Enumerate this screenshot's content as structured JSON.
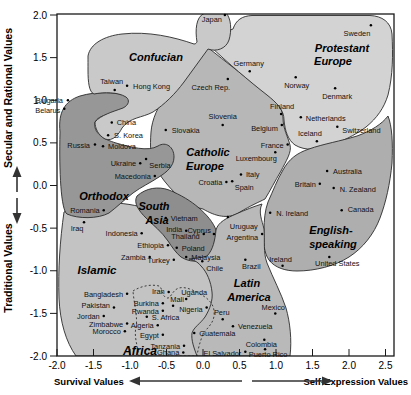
{
  "chart_data": {
    "type": "scatter",
    "xlabel_left": "Survival Values",
    "xlabel_right": "Self-Expression Values",
    "ylabel_top": "Secular and Rational Values",
    "ylabel_bottom": "Traditional Values",
    "xlim": [
      -2.0,
      2.62
    ],
    "ylim": [
      -2.0,
      2.0
    ],
    "x_ticks": [
      {
        "v": -2.0,
        "t": "-2.0"
      },
      {
        "v": -1.5,
        "t": "-1.5"
      },
      {
        "v": -1.0,
        "t": "-1.0"
      },
      {
        "v": -0.5,
        "t": "-0.5"
      },
      {
        "v": 0.0,
        "t": "0.0"
      },
      {
        "v": 0.5,
        "t": "0.5"
      },
      {
        "v": 1.0,
        "t": "1.0"
      },
      {
        "v": 1.5,
        "t": "1.5"
      },
      {
        "v": 2.0,
        "t": "2.0"
      },
      {
        "v": 2.5,
        "t": "2.5"
      }
    ],
    "y_ticks": [
      {
        "v": 2.0,
        "t": "2.0"
      },
      {
        "v": 1.5,
        "t": "1.5"
      },
      {
        "v": 1.0,
        "t": "1.0"
      },
      {
        "v": 0.5,
        "t": "0.5"
      },
      {
        "v": 0.0,
        "t": "0.0"
      },
      {
        "v": -0.5,
        "t": "-0.5"
      },
      {
        "v": -1.0,
        "t": "-1.0"
      },
      {
        "v": -1.5,
        "t": "-1.5"
      },
      {
        "v": -2.0,
        "t": "-2.0"
      }
    ],
    "grid": false,
    "regions": [
      {
        "name": "catholic-europe",
        "color": "#b7b7b7",
        "path": "M 206,46 C 192,60 178,76 168,92 C 158,106 152,119 151,132 C 150,146 150,159 156,169 C 161,177 167,185 175,193 C 183,201 193,207 203,209 C 215,216 228,220 240,212 C 250,206 259,202 265,199 C 270,191 275,181 281,171 C 286,161 292,152 290,145 C 288,137 283,129 283,118 C 283,108 276,101 266,93 C 248,79 226,62 206,46 Z",
        "label": {
          "size": 11,
          "lines": [
            {
              "t": "Catholic",
              "x": 208,
              "y": 156
            },
            {
              "t": "Europe",
              "x": 205,
              "y": 170
            }
          ]
        }
      },
      {
        "name": "protestant-europe",
        "color": "#d3d3d3",
        "path": "M 210,46 C 216,38 224,32 233,29 C 236,20 242,16 252,15.5 L 370,15.5 C 382,16 391,22 392,34 C 393,55 393,75 388,95 C 384,108 377,118 366,127 C 354,136 342,141 330,146 C 318,150 305,151 295,145 C 288,140 285,131 284,120 C 284,110 277,103 267,95 C 249,81 228,63 210,46 Z",
        "label": {
          "size": 11,
          "lines": [
            {
              "t": "Protestant",
              "x": 342,
              "y": 52
            },
            {
              "t": "Europe",
              "x": 333,
              "y": 65
            }
          ]
        }
      },
      {
        "name": "islamic",
        "color": "#c3c3c3",
        "path": "M 64,212 C 88,200 122,200 152,210 C 176,218 196,232 208,250 C 217,264 221,282 219,300 C 217,320 212,338 208,356 L 76,356 C 66,342 60,322 59,298 C 58,270 60,240 64,212 Z",
        "label": {
          "size": 11.5,
          "lines": [
            {
              "t": "Islamic",
              "x": 97,
              "y": 274
            }
          ]
        }
      },
      {
        "name": "orthodox",
        "color": "#979797",
        "path": "M 60,132 C 58,112 65,101 80,96 C 97,91 117,92 128,96 C 134,99 133,105 125,109 C 112,115 99,114 95,122 C 93,133 103,139 116,143 C 130,147 148,152 158,146 C 166,141 174,147 174,157 C 174,166 167,172 159,177 C 150,183 141,187 133,193 C 124,200 117,207 109,213 C 98,219 78,219 67,214 C 61,210 59,172 60,132 Z",
        "label": {
          "size": 11,
          "lines": [
            {
              "t": "Orthodox",
              "x": 104,
              "y": 200
            }
          ]
        }
      },
      {
        "name": "south-asia",
        "color": "#8e8e8e",
        "path": "M 137,196 C 146,188 158,186 169,190 C 181,195 191,201 199,208 C 207,215 213,222 216,230 C 218,241 214,251 207,257 C 199,263 189,262 181,257 C 176,253 172,247 168,241 C 162,232 153,225 146,218 C 139,211 133,203 137,196 Z",
        "label": {
          "size": 11,
          "lines": [
            {
              "t": "South",
              "x": 154,
              "y": 210
            },
            {
              "t": "Asia",
              "x": 157,
              "y": 224
            }
          ]
        }
      },
      {
        "name": "confucian",
        "color": "#c9c9c9",
        "path": "M 88,56 C 90,44 104,36 122,34 C 148,31 174,37 194,44 C 196,44 196,43 197,42 C 195,30 196,17 204,13.5 L 226,13 C 231,18 232,30 229,40 C 226,49 216,52 208,49 C 200,60 192,71 184,82 C 175,94 165,104 153,112 C 142,118 130,117 122,128 C 119,134 113,142 105,139 C 98,135 95,128 95,122 C 101,115 112,112 123,108 C 129,105 130,100 126,97 C 118,92 104,92 94,94 C 89,92 88,82 88,70 C 88,65 88,60 88,56 Z",
        "label": {
          "size": 11,
          "lines": [
            {
              "t": "Confucian",
              "x": 156,
              "y": 61
            }
          ]
        }
      },
      {
        "name": "english-speaking",
        "color": "#aeaeae",
        "path": "M 268,202 C 273,191 277,180 283,170 C 289,159 297,153 309,149 C 323,144 341,141 357,136 C 371,131 382,124 388,116 C 392,126 393,143 392,163 C 390,184 386,202 380,218 C 374,234 363,248 349,257 C 335,266 315,271 297,271 C 286,271 275,268 269,260 C 264,253 263,242 264,230 C 264,220 265,210 268,202 Z",
        "label": {
          "size": 11,
          "lines": [
            {
              "t": "English-",
              "x": 331,
              "y": 234
            },
            {
              "t": "speaking",
              "x": 333,
              "y": 248
            }
          ]
        }
      },
      {
        "name": "latin-america",
        "color": "#b9b9b9",
        "path": "M 262,204 C 258,212 262,220 264,229 C 265,241 263,252 267,263 C 273,278 281,293 286,308 C 290,322 292,340 290,356 L 197,356 C 194,348 191,340 192,333 C 194,327 200,324 205,317 C 210,309 213,300 212,292 C 211,282 207,272 201,266 C 197,261 193,260 189,259 C 196,258 202,258 207,256 C 213,250 215,240 216,230 C 218,222 227,218 236,214 C 245,210 255,206 262,204 Z",
        "label": {
          "size": 11,
          "lines": [
            {
              "t": "Latin",
              "x": 247,
              "y": 287
            },
            {
              "t": "America",
              "x": 249,
              "y": 301
            }
          ]
        }
      },
      {
        "name": "africa",
        "color": "none",
        "dash": "2,2.2",
        "path": "M 133,291 C 141,286 151,284 159,286 C 163,288 161,296 167,298 C 171,299 172,290 179,288 C 187,286 197,292 205,297 C 212,302 215,308 214,316 C 213,324 207,328 203,334 C 200,342 198,349 197,356 L 139,356 C 137,344 134,336 136,327 C 138,318 134,304 133,291 Z",
        "label": {
          "size": 12,
          "lines": [
            {
              "t": "Africa",
              "x": 140,
              "y": 355
            }
          ]
        }
      }
    ],
    "countries": [
      {
        "name": "Japan",
        "x": 0.3,
        "y": 2.0,
        "anchor": "end",
        "ldx": -3,
        "ldy": 7
      },
      {
        "name": "Sweden",
        "x": 2.3,
        "y": 1.88,
        "anchor": "middle",
        "ldx": -14,
        "ldy": 11
      },
      {
        "name": "Germany",
        "x": 0.64,
        "y": 1.34,
        "anchor": "middle",
        "ldx": -1,
        "ldy": -5
      },
      {
        "name": "Norway",
        "x": 1.27,
        "y": 1.27,
        "anchor": "middle",
        "ldx": 1,
        "ldy": 11
      },
      {
        "name": "Denmark",
        "x": 1.81,
        "y": 1.14,
        "anchor": "middle",
        "ldx": 2,
        "ldy": 11
      },
      {
        "name": "Taiwan",
        "x": -1.21,
        "y": 1.12,
        "anchor": "middle",
        "ldx": -3,
        "ldy": -6
      },
      {
        "name": "Hong Kong",
        "x": -1.04,
        "y": 1.17,
        "anchor": "start",
        "ldx": 6,
        "ldy": 3
      },
      {
        "name": "Czech Rep.",
        "x": 0.34,
        "y": 1.25,
        "anchor": "middle",
        "ldx": -17,
        "ldy": 11
      },
      {
        "name": "Bulgaria",
        "x": -1.85,
        "y": 1.0,
        "anchor": "end",
        "ldx": -5,
        "ldy": 3
      },
      {
        "name": "Belarus",
        "x": -1.9,
        "y": 0.9,
        "anchor": "end",
        "ldx": -4,
        "ldy": 4
      },
      {
        "name": "China",
        "x": -1.25,
        "y": 0.74,
        "anchor": "start",
        "ldx": 5,
        "ldy": 3
      },
      {
        "name": "S. Korea",
        "x": -1.3,
        "y": 0.59,
        "anchor": "start",
        "ldx": 6,
        "ldy": 3
      },
      {
        "name": "Slovakia",
        "x": -0.51,
        "y": 0.65,
        "anchor": "start",
        "ldx": 6,
        "ldy": 3
      },
      {
        "name": "Slovenia",
        "x": 0.27,
        "y": 0.71,
        "anchor": "middle",
        "ldx": 0,
        "ldy": -6
      },
      {
        "name": "Finland",
        "x": 1.07,
        "y": 0.84,
        "anchor": "middle",
        "ldx": 1,
        "ldy": -5
      },
      {
        "name": "Netherlands",
        "x": 1.34,
        "y": 0.8,
        "anchor": "start",
        "ldx": 5,
        "ldy": 4
      },
      {
        "name": "Belgium",
        "x": 1.08,
        "y": 0.71,
        "anchor": "end",
        "ldx": -4,
        "ldy": 6
      },
      {
        "name": "Iceland",
        "x": 1.56,
        "y": 0.52,
        "anchor": "middle",
        "ldx": -7,
        "ldy": -5
      },
      {
        "name": "Switzerland",
        "x": 1.84,
        "y": 0.69,
        "anchor": "start",
        "ldx": 5,
        "ldy": 6
      },
      {
        "name": "Russia",
        "x": -1.48,
        "y": 0.48,
        "anchor": "end",
        "ldx": -5,
        "ldy": 3
      },
      {
        "name": "Moldova",
        "x": -1.37,
        "y": 0.46,
        "anchor": "start",
        "ldx": 5,
        "ldy": 3
      },
      {
        "name": "Ukraine",
        "x": -0.86,
        "y": 0.26,
        "anchor": "end",
        "ldx": -4,
        "ldy": 3
      },
      {
        "name": "Serbia",
        "x": -0.78,
        "y": 0.31,
        "anchor": "middle",
        "ldx": 14,
        "ldy": 9
      },
      {
        "name": "Macedonia",
        "x": -0.66,
        "y": 0.11,
        "anchor": "end",
        "ldx": -4,
        "ldy": 3
      },
      {
        "name": "Croatia",
        "x": 0.32,
        "y": 0.04,
        "anchor": "end",
        "ldx": -4,
        "ldy": 3
      },
      {
        "name": "Italy",
        "x": 0.52,
        "y": 0.13,
        "anchor": "start",
        "ldx": 5,
        "ldy": 3
      },
      {
        "name": "Spain",
        "x": 0.4,
        "y": 0.05,
        "anchor": "middle",
        "ldx": 12,
        "ldy": 9
      },
      {
        "name": "France",
        "x": 1.16,
        "y": 0.48,
        "anchor": "end",
        "ldx": -4,
        "ldy": 3
      },
      {
        "name": "Luxembourg",
        "x": 0.99,
        "y": 0.39,
        "anchor": "middle",
        "ldx": -19,
        "ldy": 9
      },
      {
        "name": "Australia",
        "x": 1.7,
        "y": 0.17,
        "anchor": "start",
        "ldx": 6,
        "ldy": 3
      },
      {
        "name": "Britain",
        "x": 1.6,
        "y": 0.02,
        "anchor": "end",
        "ldx": -4,
        "ldy": 3
      },
      {
        "name": "N. Zealand",
        "x": 1.79,
        "y": -0.03,
        "anchor": "start",
        "ldx": 6,
        "ldy": 4
      },
      {
        "name": "Canada",
        "x": 1.9,
        "y": -0.29,
        "anchor": "start",
        "ldx": 6,
        "ldy": 2
      },
      {
        "name": "N. Ireland",
        "x": 0.92,
        "y": -0.32,
        "anchor": "start",
        "ldx": 6,
        "ldy": 3
      },
      {
        "name": "Romania",
        "x": -1.36,
        "y": -0.29,
        "anchor": "end",
        "ldx": -4,
        "ldy": 3
      },
      {
        "name": "Iraq",
        "x": -1.63,
        "y": -0.43,
        "anchor": "middle",
        "ldx": -7,
        "ldy": 9
      },
      {
        "name": "Vietnam",
        "x": -0.51,
        "y": -0.38,
        "anchor": "start",
        "ldx": 5,
        "ldy": 3
      },
      {
        "name": "India",
        "x": -0.23,
        "y": -0.53,
        "anchor": "end",
        "ldx": -4,
        "ldy": 1
      },
      {
        "name": "Cyprus",
        "x": 0.15,
        "y": -0.57,
        "anchor": "end",
        "ldx": -3,
        "ldy": -1
      },
      {
        "name": "Thailand",
        "x": 0.01,
        "y": -0.57,
        "anchor": "end",
        "ldx": -4,
        "ldy": 5
      },
      {
        "name": "Poland",
        "x": -0.36,
        "y": -0.73,
        "anchor": "start",
        "ldx": 5,
        "ldy": 3
      },
      {
        "name": "Malaysia",
        "x": -0.23,
        "y": -0.84,
        "anchor": "start",
        "ldx": 5,
        "ldy": 3
      },
      {
        "name": "Ethiopia",
        "x": -0.48,
        "y": -0.7,
        "anchor": "end",
        "ldx": -4,
        "ldy": 3
      },
      {
        "name": "Zambia",
        "x": -0.73,
        "y": -0.84,
        "anchor": "end",
        "ldx": -4,
        "ldy": 3
      },
      {
        "name": "Turkey",
        "x": -0.4,
        "y": -0.87,
        "anchor": "end",
        "ldx": -4,
        "ldy": 3
      },
      {
        "name": "Indonesia",
        "x": -0.84,
        "y": -0.56,
        "anchor": "end",
        "ldx": -4,
        "ldy": 3
      },
      {
        "name": "Chile",
        "x": -0.01,
        "y": -0.89,
        "anchor": "start",
        "ldx": 4,
        "ldy": 10
      },
      {
        "name": "Uruguay",
        "x": 0.34,
        "y": -0.37,
        "anchor": "start",
        "ldx": 2,
        "ldy": 12
      },
      {
        "name": "Argentina",
        "x": 0.81,
        "y": -0.57,
        "anchor": "end",
        "ldx": -4,
        "ldy": 6
      },
      {
        "name": "Brazil",
        "x": 0.58,
        "y": -0.87,
        "anchor": "middle",
        "ldx": 6,
        "ldy": 9
      },
      {
        "name": "Ireland",
        "x": 1.09,
        "y": -0.94,
        "anchor": "middle",
        "ldx": -2,
        "ldy": -4
      },
      {
        "name": "United States",
        "x": 1.73,
        "y": -0.84,
        "anchor": "middle",
        "ldx": 8,
        "ldy": 9
      },
      {
        "name": "Uganda",
        "x": -0.23,
        "y": -1.33,
        "anchor": "middle",
        "ldx": 8,
        "ldy": -4
      },
      {
        "name": "Iran",
        "x": -0.47,
        "y": -1.25,
        "anchor": "end",
        "ldx": -4,
        "ldy": 2
      },
      {
        "name": "Bangladesh",
        "x": -1.04,
        "y": -1.27,
        "anchor": "end",
        "ldx": -4,
        "ldy": 3
      },
      {
        "name": "Burkina",
        "x": -0.55,
        "y": -1.38,
        "anchor": "end",
        "ldx": -4,
        "ldy": 3
      },
      {
        "name": "Mali",
        "x": -0.41,
        "y": -1.41,
        "anchor": "middle",
        "ldx": 4,
        "ldy": -4
      },
      {
        "name": "Rwanda",
        "x": -0.55,
        "y": -1.47,
        "anchor": "end",
        "ldx": -4,
        "ldy": 3
      },
      {
        "name": "Nigeria",
        "x": 0.05,
        "y": -1.43,
        "anchor": "end",
        "ldx": -4,
        "ldy": 5
      },
      {
        "name": "Pakistan",
        "x": -1.22,
        "y": -1.43,
        "anchor": "end",
        "ldx": -4,
        "ldy": 1
      },
      {
        "name": "Jordan",
        "x": -1.36,
        "y": -1.53,
        "anchor": "end",
        "ldx": -4,
        "ldy": 3
      },
      {
        "name": "S. Africa",
        "x": -0.77,
        "y": -1.54,
        "anchor": "start",
        "ldx": 5,
        "ldy": 3
      },
      {
        "name": "Zimbabwe",
        "x": -1.04,
        "y": -1.62,
        "anchor": "end",
        "ldx": -4,
        "ldy": 3
      },
      {
        "name": "Algeria",
        "x": -0.62,
        "y": -1.64,
        "anchor": "end",
        "ldx": -4,
        "ldy": 3
      },
      {
        "name": "Morocco",
        "x": -1.07,
        "y": -1.71,
        "anchor": "end",
        "ldx": -4,
        "ldy": 3
      },
      {
        "name": "Egypt",
        "x": -0.55,
        "y": -1.75,
        "anchor": "end",
        "ldx": -4,
        "ldy": 3
      },
      {
        "name": "Guatemala",
        "x": -0.12,
        "y": -1.73,
        "anchor": "start",
        "ldx": 5,
        "ldy": 3
      },
      {
        "name": "Peru",
        "x": 0.27,
        "y": -1.57,
        "anchor": "middle",
        "ldx": -1,
        "ldy": -4
      },
      {
        "name": "Venezuela",
        "x": 0.41,
        "y": -1.65,
        "anchor": "start",
        "ldx": 5,
        "ldy": 3
      },
      {
        "name": "Mexico",
        "x": 0.99,
        "y": -1.5,
        "anchor": "middle",
        "ldx": -2,
        "ldy": -3
      },
      {
        "name": "Colombia",
        "x": 0.84,
        "y": -1.81,
        "anchor": "middle",
        "ldx": -3,
        "ldy": 7
      },
      {
        "name": "El Salvador",
        "x": 0.58,
        "y": -1.95,
        "anchor": "end",
        "ldx": -4,
        "ldy": 4
      },
      {
        "name": "Puerto Rico",
        "x": 0.85,
        "y": -1.92,
        "anchor": "middle",
        "ldx": 3,
        "ldy": 8
      },
      {
        "name": "Tanzania",
        "x": -0.26,
        "y": -1.88,
        "anchor": "end",
        "ldx": -4,
        "ldy": 3
      },
      {
        "name": "Ghana",
        "x": -0.27,
        "y": -1.96,
        "anchor": "end",
        "ldx": -4,
        "ldy": 2
      }
    ],
    "style": {
      "frame_color": "#1a1a1a",
      "region_stroke": "#2b2b2b",
      "dot_color": "#000000",
      "country_font_px": 7.4,
      "tick_font_px": 10,
      "axis_title_font_px": 10.5,
      "bottom_title_font_px": 9.5,
      "plot": {
        "left": 57,
        "right": 394,
        "top": 14,
        "bottom": 356,
        "x0_px": 203,
        "px_per_x": 73,
        "y0_px": 185.5,
        "px_per_y": 85.25
      }
    }
  }
}
